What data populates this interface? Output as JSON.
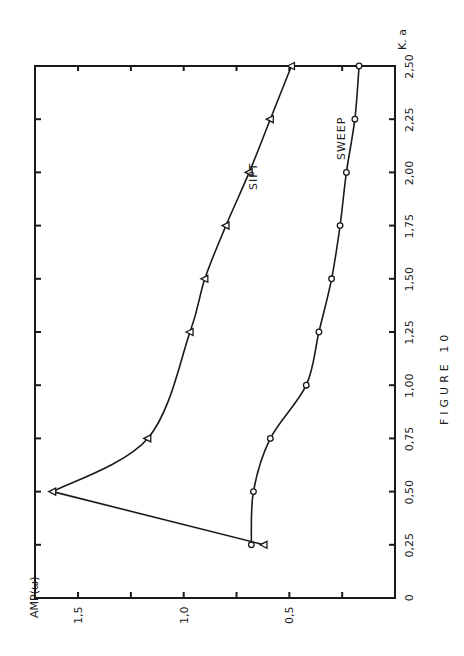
{
  "figure_label": "FIGURE 10",
  "axes": {
    "x_label": "K. a",
    "y_label": "AMP(ω)",
    "x_ticks": [
      "0",
      "0,25",
      "0,50",
      "0,75",
      "1,00",
      "1,25",
      "1,50",
      "1,75",
      "2,00",
      "2,25",
      "2,50"
    ],
    "y_ticks": [
      "0,5",
      "1,0",
      "1,5"
    ]
  },
  "series_labels": {
    "sipt": "SIPT",
    "sweep": "SWEEP"
  },
  "chart_data": {
    "type": "line",
    "title": "FIGURE 10",
    "xlabel": "K. a",
    "ylabel": "AMP(ω)",
    "orientation": "rotated 90° counter-clockwise on page",
    "xlim": [
      0,
      2.5
    ],
    "ylim": [
      0,
      1.6
    ],
    "grid": false,
    "legend": "inline labels",
    "x": [
      0.25,
      0.5,
      0.75,
      1.0,
      1.25,
      1.5,
      1.75,
      2.0,
      2.25,
      2.5
    ],
    "series": [
      {
        "name": "SIPT",
        "marker": "triangle",
        "values": [
          0.62,
          1.62,
          1.17,
          null,
          0.97,
          0.9,
          0.8,
          0.69,
          0.59,
          0.49
        ]
      },
      {
        "name": "SWEEP",
        "marker": "circle",
        "values": [
          0.68,
          0.67,
          0.59,
          0.42,
          0.36,
          0.3,
          0.26,
          0.23,
          0.19,
          0.17
        ]
      }
    ]
  }
}
